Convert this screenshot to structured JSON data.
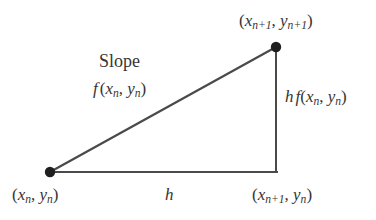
{
  "figure": {
    "background_color": "#ffffff",
    "stroke_color": "#4a4a4a",
    "text_color": "#353535",
    "line_width": 2,
    "dot_radius": 5
  },
  "geometry": {
    "point_start": {
      "x": 50,
      "y": 172
    },
    "point_end": {
      "x": 276,
      "y": 47
    },
    "point_corner": {
      "x": 276,
      "y": 172
    },
    "hypotenuse": {
      "x1": 50,
      "y1": 172,
      "x2": 276,
      "y2": 47
    },
    "vertical_leg": {
      "x1": 276,
      "y1": 47,
      "x2": 276,
      "y2": 172
    },
    "horizontal_leg": {
      "x1": 50,
      "y1": 172,
      "x2": 276,
      "y2": 172
    },
    "dots": [
      {
        "name": "start-point-dot",
        "x": 50,
        "y": 172
      },
      {
        "name": "end-point-dot",
        "x": 276,
        "y": 47
      }
    ]
  },
  "labels": {
    "top_vertex": {
      "open_paren": "(",
      "x_var": "x",
      "x_sub": "n+1",
      "comma": ", ",
      "y_var": "y",
      "y_sub": "n+1",
      "close_paren": ")",
      "plain": "(x_{n+1}, y_{n+1})"
    },
    "slope_word": "Slope",
    "slope_expr": {
      "f_var": "f",
      "open_paren": "(",
      "x_var": "x",
      "x_sub": "n",
      "comma": ", ",
      "y_var": "y",
      "y_sub": "n",
      "close_paren": ")",
      "plain": "f(x_n, y_n)"
    },
    "rise": {
      "h_var": "h",
      "f_var": "f",
      "open_paren": "(",
      "x_var": "x",
      "x_sub": "n",
      "comma": ", ",
      "y_var": "y",
      "y_sub": "n",
      "close_paren": ")",
      "plain": "h f(x_n, y_n)"
    },
    "bottom_left_vertex": {
      "open_paren": "(",
      "x_var": "x",
      "x_sub": "n",
      "comma": ", ",
      "y_var": "y",
      "y_sub": "n",
      "close_paren": ")",
      "plain": "(x_n, y_n)"
    },
    "base": {
      "h_var": "h",
      "plain": "h"
    },
    "bottom_right_vertex": {
      "open_paren": "(",
      "x_var": "x",
      "x_sub": "n+1",
      "comma": ", ",
      "y_var": "y",
      "y_sub": "n",
      "close_paren": ")",
      "plain": "(x_{n+1}, y_n)"
    }
  }
}
